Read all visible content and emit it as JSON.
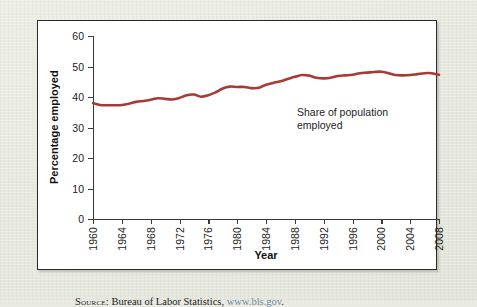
{
  "figure": {
    "source_label": "Source:",
    "source_text": " Bureau of Labor Statistics, ",
    "source_url": "www.bls.gov",
    "source_period": "."
  },
  "colors": {
    "line": "#a83a33",
    "page_background": "#e9eae1",
    "plot_background": "#ffffff",
    "frame_border": "#2b2b2b",
    "axis": "#3a3a3a",
    "url_link": "#6d8ba8"
  },
  "chart_data": {
    "type": "line",
    "title": "",
    "xlabel": "Year",
    "ylabel": "Percentage employed",
    "xlim": [
      1960,
      2008
    ],
    "ylim": [
      0,
      60
    ],
    "grid": false,
    "legend": "none",
    "annotations": [
      {
        "text": "Share of population\nemployed",
        "x": 1993,
        "y": 42
      }
    ],
    "ytick_labels": [
      "0",
      "10",
      "20",
      "30",
      "40",
      "50",
      "60"
    ],
    "yticks": [
      0,
      10,
      20,
      30,
      40,
      50,
      60
    ],
    "xtick_labels": [
      "1960",
      "1964",
      "1968",
      "1972",
      "1976",
      "1980",
      "1984",
      "1988",
      "1992",
      "1996",
      "2000",
      "2004",
      "2008"
    ],
    "xticks": [
      1960,
      1964,
      1968,
      1972,
      1976,
      1980,
      1984,
      1988,
      1992,
      1996,
      2000,
      2004,
      2008
    ],
    "series": [
      {
        "name": "Share of population employed",
        "color": "#a83a33",
        "x": [
          1960,
          1961,
          1962,
          1963,
          1964,
          1965,
          1966,
          1967,
          1968,
          1969,
          1970,
          1971,
          1972,
          1973,
          1974,
          1975,
          1976,
          1977,
          1978,
          1979,
          1980,
          1981,
          1982,
          1983,
          1984,
          1985,
          1986,
          1987,
          1988,
          1989,
          1990,
          1991,
          1992,
          1993,
          1994,
          1995,
          1996,
          1997,
          1998,
          1999,
          2000,
          2001,
          2002,
          2003,
          2004,
          2005,
          2006,
          2007,
          2008
        ],
        "values": [
          38.0,
          37.4,
          37.3,
          37.3,
          37.4,
          37.8,
          38.4,
          38.7,
          39.1,
          39.6,
          39.4,
          39.2,
          39.7,
          40.6,
          40.8,
          40.1,
          40.6,
          41.5,
          42.8,
          43.4,
          43.3,
          43.3,
          42.9,
          43.0,
          44.0,
          44.6,
          45.2,
          45.9,
          46.6,
          47.2,
          47.0,
          46.3,
          46.1,
          46.3,
          46.9,
          47.1,
          47.3,
          47.8,
          48.0,
          48.2,
          48.3,
          47.8,
          47.2,
          47.1,
          47.2,
          47.5,
          47.8,
          47.8,
          47.3
        ],
        "units": "percent"
      }
    ]
  }
}
